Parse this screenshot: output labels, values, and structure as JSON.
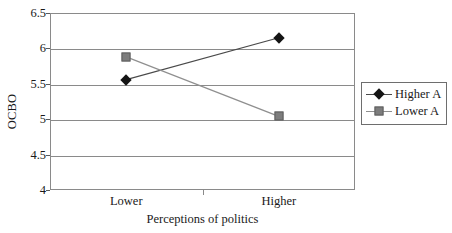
{
  "chart_data": {
    "type": "line",
    "title": "",
    "subtitle": "",
    "xlabel": "Perceptions of politics",
    "ylabel": "OCBO",
    "categories": [
      "Lower",
      "Higher"
    ],
    "ylim": [
      4,
      6.5
    ],
    "yticks": [
      "4",
      "4.5",
      "5",
      "5.5",
      "6",
      "6.5"
    ],
    "ytick_values": [
      4,
      4.5,
      5,
      5.5,
      6,
      6.5
    ],
    "grid": true,
    "legend_position": "right",
    "series": [
      {
        "name": "Higher A",
        "values": [
          5.56,
          6.15
        ],
        "marker": "diamond",
        "color": "#141414",
        "line_color": "#4a4a4a"
      },
      {
        "name": "Lower A",
        "values": [
          5.88,
          5.04
        ],
        "marker": "square",
        "color": "#7d7d7d",
        "line_color": "#8f8f8f"
      }
    ]
  },
  "axes": {
    "y_title": "OCBO",
    "x_title": "Perceptions of politics"
  },
  "legend": {
    "items": [
      {
        "label": "Higher A",
        "marker": "diamond-marker-icon"
      },
      {
        "label": "Lower A",
        "marker": "square-marker-icon"
      }
    ]
  },
  "colors": {
    "frame": "#8a8a8a",
    "gridline": "#8a8a8a",
    "series_higher": "#141414",
    "series_lower": "#7d7d7d",
    "text": "#1a1a1a",
    "background": "#ffffff"
  }
}
